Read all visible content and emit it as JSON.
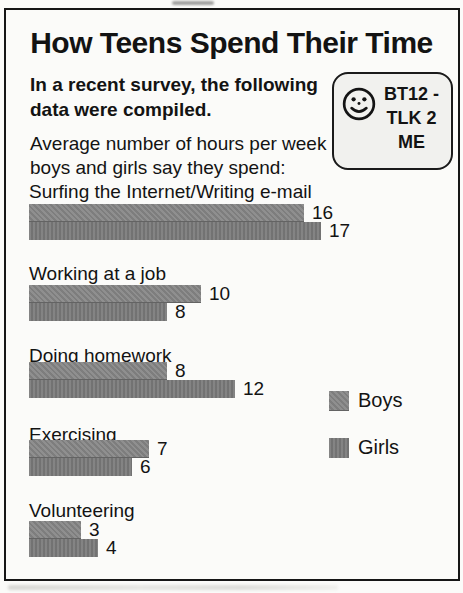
{
  "page": {
    "title": "How Teens Spend Their Time",
    "intro_lines": [
      "In a recent survey, the following",
      "data were compiled."
    ],
    "description_lines": [
      "Average number of hours per week",
      "boys and girls say they spend:"
    ],
    "badge": {
      "icon": "smiley-face-icon",
      "lines": [
        "BT12 -",
        "TLK 2",
        "ME"
      ]
    }
  },
  "chart_data": {
    "type": "bar",
    "orientation": "horizontal",
    "title": "How Teens Spend Their Time",
    "subtitle": "Average number of hours per week boys and girls say they spend",
    "value_unit": "hours per week",
    "categories": [
      "Surfing the Internet/Writing e-mail",
      "Working at a job",
      "Doing homework",
      "Exercising",
      "Volunteering"
    ],
    "series": [
      {
        "name": "Boys",
        "color": "#878787",
        "values": [
          16,
          10,
          8,
          7,
          3
        ]
      },
      {
        "name": "Girls",
        "color": "#7c7c7c",
        "values": [
          17,
          8,
          12,
          6,
          4
        ]
      }
    ],
    "data_labels": true,
    "legend_position": "right",
    "xlim": [
      0,
      17
    ],
    "grid": false
  },
  "colors": {
    "bar_boys": "#878787",
    "bar_girls": "#7c7c7c",
    "frame_border": "#161616",
    "badge_background": "#f1f1ee",
    "page_background": "#fbfbf9",
    "text": "#131313"
  }
}
